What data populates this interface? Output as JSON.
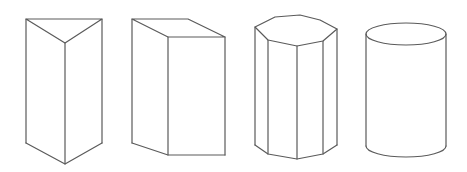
{
  "diagram": {
    "stroke_color": "#5a5a5a",
    "background": "#ffffff",
    "shapes": [
      {
        "name": "triangular-prism",
        "top_face": [
          [
            26,
            19
          ],
          [
            102,
            19
          ],
          [
            65,
            43
          ]
        ],
        "bottom_vertices": [
          [
            26,
            143
          ],
          [
            65,
            164
          ],
          [
            102,
            143
          ]
        ]
      },
      {
        "name": "rectangular-prism",
        "top_face": [
          [
            132,
            19
          ],
          [
            188,
            19
          ],
          [
            225,
            37
          ],
          [
            168,
            37
          ]
        ],
        "bottom_vertices": [
          [
            132,
            143
          ],
          [
            168,
            155
          ],
          [
            225,
            155
          ]
        ]
      },
      {
        "name": "octagonal-prism",
        "top_face": [
          [
            255,
            27
          ],
          [
            275,
            17
          ],
          [
            300,
            15
          ],
          [
            320,
            20
          ],
          [
            337,
            29
          ],
          [
            323,
            41
          ],
          [
            297,
            46
          ],
          [
            268,
            40
          ]
        ],
        "bottom_vertices": [
          [
            255,
            145
          ],
          [
            268,
            154
          ],
          [
            297,
            159
          ],
          [
            323,
            154
          ],
          [
            337,
            145
          ]
        ]
      },
      {
        "name": "cylinder",
        "center_x": 406,
        "top_y": 34,
        "bottom_y": 146,
        "rx": 40,
        "ry": 11
      }
    ]
  }
}
